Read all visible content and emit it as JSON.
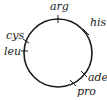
{
  "diagram": {
    "type": "circular-genetic-map",
    "circle": {
      "cx": 58,
      "cy": 53,
      "r": 34,
      "stroke": "#1a1a1a"
    },
    "markers": [
      {
        "gene": "arg",
        "angle_deg": -90
      },
      {
        "gene": "his",
        "angle_deg": -35
      },
      {
        "gene": "ade",
        "angle_deg": 40
      },
      {
        "gene": "pro",
        "angle_deg": 62
      },
      {
        "gene": "cys",
        "angle_deg": 200
      },
      {
        "gene": "leu",
        "angle_deg": 180
      }
    ],
    "labels": {
      "arg": "arg",
      "his": "his",
      "cys": "cys",
      "leu": "leu",
      "ade": "ade",
      "pro": "pro"
    }
  }
}
